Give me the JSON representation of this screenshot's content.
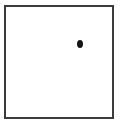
{
  "figure": {
    "canvas": {
      "width": 122,
      "height": 127,
      "background_color": "#ffffff"
    },
    "frame": {
      "name": "rectangular-boundary",
      "shape": "rectangle",
      "stroke_color": "#3b3b3b",
      "stroke_width": 2,
      "fill_color": "#ffffff",
      "left": 4,
      "top": 5,
      "width": 110,
      "height": 114
    },
    "point": {
      "name": "plotted-point",
      "shape": "ellipse",
      "fill_color": "#141414",
      "center_x": 79.5,
      "center_y": 43.5,
      "width": 6,
      "height": 8,
      "quadrant": "upper-right"
    }
  },
  "chart_data": {
    "type": "scatter",
    "title": "",
    "xlabel": "",
    "ylabel": "",
    "grid": false,
    "legend": null,
    "xlim": [
      0,
      110
    ],
    "ylim": [
      0,
      114
    ],
    "axis_ticks": {
      "x": [],
      "y": []
    },
    "series": [
      {
        "name": "point",
        "marker": "filled-ellipse",
        "color": "#141414",
        "x": [
          75.5
        ],
        "y": [
          75.5
        ]
      }
    ],
    "annotations": []
  }
}
